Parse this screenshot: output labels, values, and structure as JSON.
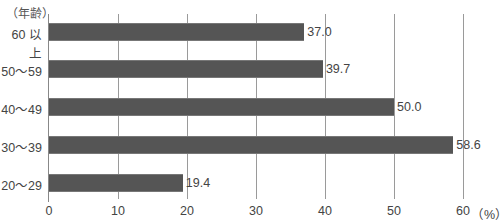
{
  "chart_data": {
    "type": "bar",
    "orientation": "horizontal",
    "title": "",
    "ylabel": "（年齢）",
    "xlabel": "（%）",
    "categories": [
      "60 以上",
      "50～59",
      "40～49",
      "30～39",
      "20～29"
    ],
    "values": [
      37.0,
      39.7,
      50.0,
      58.6,
      19.4
    ],
    "value_labels": [
      "37.0",
      "39.7",
      "50.0",
      "58.6",
      "19.4"
    ],
    "xlim": [
      0,
      60
    ],
    "xticks": [
      "0",
      "10",
      "20",
      "30",
      "40",
      "50",
      "60"
    ],
    "grid": true,
    "bar_color": "#555555"
  }
}
